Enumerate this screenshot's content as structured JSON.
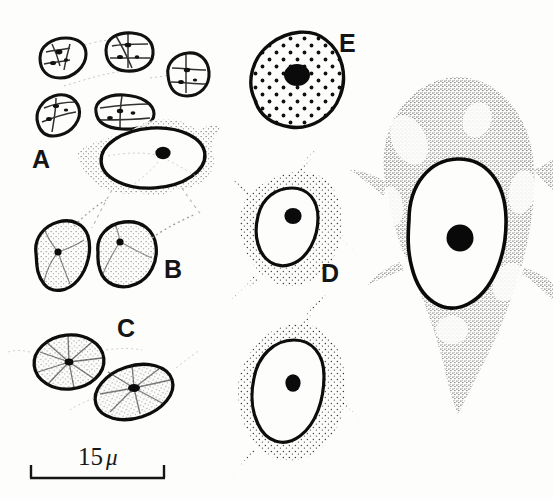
{
  "figure": {
    "kind": "scientific-line-drawing",
    "background_color": "#fdfdfb",
    "ink_color": "#121212",
    "panel_labels": [
      {
        "id": "A",
        "text": "A",
        "x": 32,
        "y": 147
      },
      {
        "id": "B",
        "text": "B",
        "x": 164,
        "y": 257
      },
      {
        "id": "C",
        "text": "C",
        "x": 117,
        "y": 316
      },
      {
        "id": "D",
        "text": "D",
        "x": 321,
        "y": 261
      },
      {
        "id": "E",
        "text": "E",
        "x": 339,
        "y": 31
      }
    ],
    "scale_bar": {
      "value": "15",
      "unit": "μ",
      "label": "15 μ",
      "x1": 30,
      "x2": 165,
      "y": 478,
      "cap_height": 13,
      "text_x": 78,
      "text_y": 444
    },
    "panels": [
      {
        "id": "A",
        "description": "cluster of small rounded mitotic cells above one flattened spindle-shaped cell with oval nucleus and dark nucleolus"
      },
      {
        "id": "B",
        "description": "two rounded cells with fine stippled cytoplasm, small dark nucleoli and tapering tail processes"
      },
      {
        "id": "C",
        "description": "two oval cells with radiating internal spoke pattern and dark central nucleoli"
      },
      {
        "id": "D",
        "description": "two large pear-shaped fibroblast-like cells with stippled cytoplasm, clear nuclei and round dark nucleoli"
      },
      {
        "id": "E",
        "description": "round cell with evenly dotted cytoplasm and large dark central nucleolus"
      },
      {
        "id": "F",
        "description": "very large elongated spread cell with dense stippled cytoplasm, big clear oval nucleus and prominent dark nucleolus"
      }
    ]
  }
}
